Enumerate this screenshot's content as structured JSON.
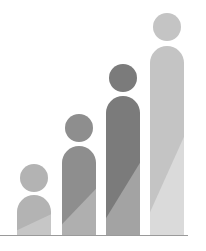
{
  "illustration": {
    "title": "",
    "description": "Four person-shaped bars of increasing height (growth graphic)",
    "baseline": {
      "y": 235,
      "x1": 0,
      "x2": 188,
      "color": "#9a9a9a"
    },
    "figures": [
      {
        "id": 1,
        "head": {
          "cx": 34,
          "cy": 178,
          "r": 14
        },
        "body": {
          "x": 17,
          "top": 195,
          "width": 34,
          "bottom": 235
        },
        "color": "#b3b3b3",
        "shade": "#c6c6c6"
      },
      {
        "id": 2,
        "head": {
          "cx": 79,
          "cy": 128,
          "r": 14
        },
        "body": {
          "x": 62,
          "top": 146,
          "width": 34,
          "bottom": 235
        },
        "color": "#8e8e8e",
        "shade": "#afafaf"
      },
      {
        "id": 3,
        "head": {
          "cx": 123,
          "cy": 78,
          "r": 14
        },
        "body": {
          "x": 106,
          "top": 96,
          "width": 34,
          "bottom": 235
        },
        "color": "#7b7b7b",
        "shade": "#a3a3a3"
      },
      {
        "id": 4,
        "head": {
          "cx": 167,
          "cy": 27,
          "r": 14
        },
        "body": {
          "x": 150,
          "top": 46,
          "width": 34,
          "bottom": 235
        },
        "color": "#c4c4c4",
        "shade": "#dadada"
      }
    ]
  }
}
